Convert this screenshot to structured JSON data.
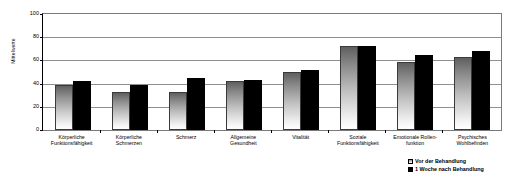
{
  "chart_data": {
    "type": "bar",
    "title": "",
    "xlabel": "",
    "ylabel": "Mittelwerte",
    "ylim": [
      0,
      100
    ],
    "yticks": [
      0,
      20,
      40,
      60,
      80,
      100
    ],
    "grid": true,
    "legend_position": "bottom-right",
    "categories": [
      "Körperliche Funktionsfähigkeit",
      "Körperliche Schmerzen",
      "Schmerz",
      "Allgemeine Gesundheit",
      "Vitalität",
      "Soziale Funktionsfähigkeit",
      "Emotionale Rollenfunktion",
      "Psychisches Wohlbefinden"
    ],
    "series": [
      {
        "name": "Vor der Behandlung",
        "values": [
          38.5,
          32.5,
          32.5,
          42,
          50,
          72.5,
          59,
          63
        ]
      },
      {
        "name": "1 Woche nach Behandlung",
        "values": [
          42.5,
          38.5,
          44.5,
          43.5,
          52,
          72.5,
          65,
          68
        ]
      }
    ]
  },
  "axis": {
    "y_title": "Mittelwerte",
    "ticks": [
      "100",
      "80",
      "60",
      "40",
      "20",
      "0"
    ]
  },
  "categories": [
    {
      "line1": "Körperliche",
      "line2": "Funktionsfähigkeit"
    },
    {
      "line1": "Körperliche",
      "line2": "Schmerzen"
    },
    {
      "line1": "Schmerz",
      "line2": ""
    },
    {
      "line1": "Allgemeine",
      "line2": "Gesundheit"
    },
    {
      "line1": "Vitalität",
      "line2": ""
    },
    {
      "line1": "Soziale",
      "line2": "Funktionsfähigkeit"
    },
    {
      "line1": "Emotionale Rollen-",
      "line2": "funktion"
    },
    {
      "line1": "Psychisches",
      "line2": "Wohlbefinden"
    }
  ],
  "legend": {
    "items": [
      {
        "label": "Vor der Behandlung",
        "color": "#bfbfbf"
      },
      {
        "label": "1 Woche nach Behandlung",
        "color": "#000000"
      }
    ]
  }
}
